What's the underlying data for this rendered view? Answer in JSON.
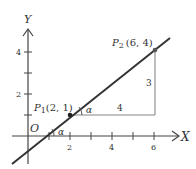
{
  "diagram": {
    "type": "coordinate-plane-line-slope",
    "axes": {
      "x_label": "X",
      "y_label": "Y",
      "origin_label": "O",
      "x_ticks": [
        {
          "value": 1,
          "label": ""
        },
        {
          "value": 2,
          "label": "2"
        },
        {
          "value": 3,
          "label": ""
        },
        {
          "value": 4,
          "label": "4"
        },
        {
          "value": 5,
          "label": ""
        },
        {
          "value": 6,
          "label": "6"
        }
      ],
      "y_ticks": [
        {
          "value": 1,
          "label": ""
        },
        {
          "value": 2,
          "label": "2"
        },
        {
          "value": 3,
          "label": ""
        },
        {
          "value": 4,
          "label": "4"
        }
      ]
    },
    "points": {
      "p1": {
        "name": "P",
        "subscript": "1",
        "coords": "(2, 1)",
        "x": 2,
        "y": 1
      },
      "p2": {
        "name": "P",
        "subscript": "2",
        "coords": "(6, 4)",
        "x": 6,
        "y": 4
      }
    },
    "triangle": {
      "run_label": "4",
      "rise_label": "3"
    },
    "angles": {
      "at_x_axis": "α",
      "at_p1": "α"
    },
    "colors": {
      "line": "#333333",
      "axis": "#444444",
      "triangle": "#888888",
      "text": "#333333"
    }
  }
}
